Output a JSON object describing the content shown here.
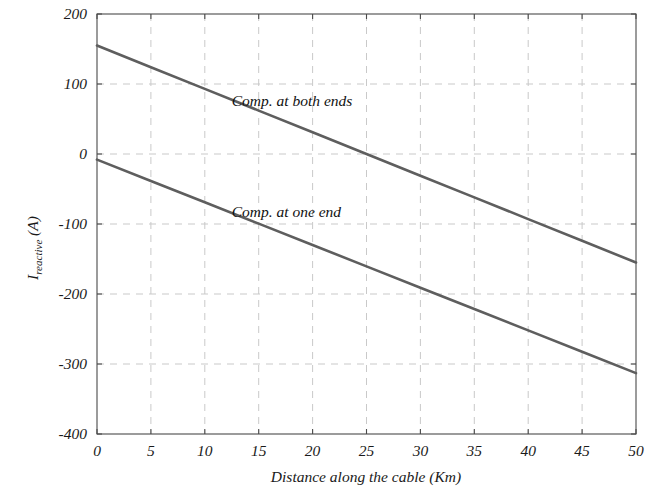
{
  "chart_data": {
    "type": "line",
    "title": "",
    "xlabel": "Distance along the cable (Km)",
    "ylabel_main": "I",
    "ylabel_sub": "reactive",
    "ylabel_unit": " (A)",
    "ylabel_full": "I_reactive (A)",
    "xlim": [
      0,
      50
    ],
    "ylim": [
      -400,
      200
    ],
    "xticks": [
      0,
      5,
      10,
      15,
      20,
      25,
      30,
      35,
      40,
      45,
      50
    ],
    "xtick_labels": [
      "0",
      "5",
      "10",
      "15",
      "20",
      "25",
      "30",
      "35",
      "40",
      "45",
      "50"
    ],
    "yticks": [
      200,
      100,
      0,
      -100,
      -200,
      -300,
      -400
    ],
    "ytick_labels": [
      "200",
      "100",
      "0",
      "-100",
      "-200",
      "-300",
      "-400"
    ],
    "grid": true,
    "grid_style": "dashed",
    "grid_color": "#c9c9c9",
    "legend": "inline-annotations",
    "line_color": "#5e5e5e",
    "series": [
      {
        "name": "Comp. at both ends",
        "annotation": "Comp. at both ends",
        "annotation_x": 12.5,
        "annotation_y": 68,
        "x": [
          0,
          5,
          10,
          15,
          20,
          25,
          30,
          35,
          40,
          45,
          50
        ],
        "values": [
          155,
          124,
          93,
          62,
          31,
          0,
          -31,
          -62,
          -93,
          -124,
          -155
        ]
      },
      {
        "name": "Comp. at one end",
        "annotation": "Comp. at one end",
        "annotation_x": 12.5,
        "annotation_y": -90,
        "x": [
          0,
          5,
          10,
          15,
          20,
          25,
          30,
          35,
          40,
          45,
          50
        ],
        "values": [
          -8,
          -38.5,
          -69,
          -99.5,
          -130,
          -160.5,
          -191,
          -221.5,
          -252,
          -282.5,
          -313
        ]
      }
    ]
  }
}
